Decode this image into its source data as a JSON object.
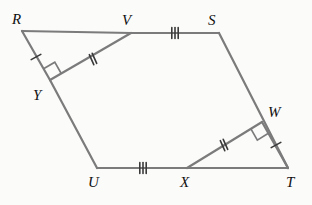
{
  "figure": {
    "type": "geometry-diagram",
    "width": 312,
    "height": 205,
    "background_color": "#fbfbfa",
    "stroke_color": "#7b7b7b",
    "tick_color": "#3a3a3a",
    "label_color": "#111111",
    "stroke_width": 2.2
  },
  "points": [
    {
      "name": "R",
      "x": 22,
      "y": 31,
      "label": "R",
      "label_x": 12,
      "label_y": 12
    },
    {
      "name": "V",
      "x": 131,
      "y": 33,
      "label": "V",
      "label_x": 122,
      "label_y": 13
    },
    {
      "name": "S",
      "x": 219,
      "y": 33,
      "label": "S",
      "label_x": 208,
      "label_y": 13
    },
    {
      "name": "W",
      "x": 262,
      "y": 122,
      "label": "W",
      "label_x": 268,
      "label_y": 105
    },
    {
      "name": "T",
      "x": 288,
      "y": 168,
      "label": "T",
      "label_x": 286,
      "label_y": 175
    },
    {
      "name": "X",
      "x": 187,
      "y": 168,
      "label": "X",
      "label_x": 180,
      "label_y": 175
    },
    {
      "name": "U",
      "x": 97,
      "y": 168,
      "label": "U",
      "label_x": 88,
      "label_y": 175
    },
    {
      "name": "Y",
      "x": 50,
      "y": 80,
      "label": "Y",
      "label_x": 33,
      "label_y": 88
    }
  ],
  "segments": [
    {
      "name": "RV",
      "from": "R",
      "to": "V",
      "ticks": 0
    },
    {
      "name": "VS",
      "from": "V",
      "to": "S",
      "ticks": 3
    },
    {
      "name": "ST",
      "from": "S",
      "to": "T",
      "ticks": 0
    },
    {
      "name": "TX",
      "from": "T",
      "to": "X",
      "ticks": 0
    },
    {
      "name": "XU",
      "from": "X",
      "to": "U",
      "ticks": 3
    },
    {
      "name": "UY",
      "from": "U",
      "to": "Y",
      "ticks": 0
    },
    {
      "name": "YR",
      "from": "Y",
      "to": "R",
      "ticks": 1
    },
    {
      "name": "YV",
      "from": "Y",
      "to": "V",
      "ticks": 2
    },
    {
      "name": "XW",
      "from": "X",
      "to": "W",
      "ticks": 2
    },
    {
      "name": "WT",
      "from": "W",
      "to": "T",
      "ticks": 1
    }
  ],
  "tick_marks": [
    {
      "name": "tick-RY",
      "segment": "YR",
      "count": 1,
      "x": 36,
      "y": 57,
      "angle_deg": 61
    },
    {
      "name": "tick-YV",
      "segment": "YV",
      "count": 2,
      "x": 93,
      "y": 59,
      "angle_deg": -24
    },
    {
      "name": "tick-VS",
      "segment": "VS",
      "count": 3,
      "x": 175,
      "y": 33,
      "angle_deg": 0
    },
    {
      "name": "tick-UX",
      "segment": "XU",
      "count": 3,
      "x": 143,
      "y": 168,
      "angle_deg": 0
    },
    {
      "name": "tick-XW",
      "segment": "XW",
      "count": 2,
      "x": 224,
      "y": 145,
      "angle_deg": -24
    },
    {
      "name": "tick-WT",
      "segment": "WT",
      "count": 1,
      "x": 276,
      "y": 145,
      "angle_deg": 61
    }
  ],
  "right_angles": [
    {
      "name": "right-angle-at-Y",
      "vertex": "Y",
      "x": 50,
      "y": 80,
      "arm1": "R",
      "arm2": "V",
      "size": 13
    },
    {
      "name": "right-angle-at-W",
      "vertex": "W",
      "x": 262,
      "y": 122,
      "arm1": "T",
      "arm2": "X",
      "size": 13
    }
  ]
}
